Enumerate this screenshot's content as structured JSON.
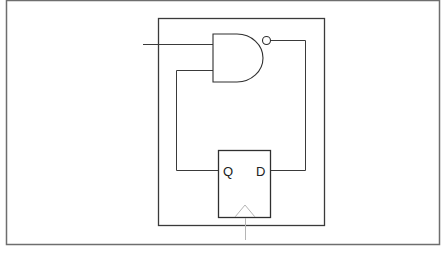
{
  "diagram": {
    "type": "logic-circuit",
    "components": {
      "nand_gate": {
        "label": "NAND gate",
        "inputs": 2,
        "output_inverted": true
      },
      "flip_flop": {
        "label": "D flip-flop",
        "pins": {
          "q": "Q",
          "d": "D",
          "clock": "clock"
        }
      }
    },
    "connections": [
      {
        "from": "external input",
        "to": "NAND input 1"
      },
      {
        "from": "flip-flop Q",
        "to": "NAND input 2"
      },
      {
        "from": "NAND output",
        "to": "flip-flop D"
      },
      {
        "from": "clock line",
        "to": "flip-flop clock"
      }
    ],
    "colors": {
      "line": "#3a3a3a",
      "frame": "#6e6e6e",
      "clock": "#b5b5b5",
      "background": "#ffffff"
    }
  }
}
